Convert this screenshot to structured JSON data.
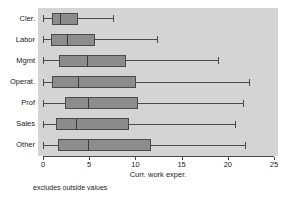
{
  "chart_data": {
    "type": "box",
    "orientation": "horizontal",
    "title": "",
    "xlabel": "Curr. work exper.",
    "ylabel": "",
    "footnote": "excludes outside values",
    "xlim": [
      0,
      25
    ],
    "xticks": [
      0,
      5,
      10,
      15,
      20,
      25
    ],
    "xtick_labels": [
      "0",
      "5",
      "10",
      "15",
      "20",
      "25"
    ],
    "grid": false,
    "legend": null,
    "categories": [
      "Cler.",
      "Labor",
      "Mgmt",
      "Operat.",
      "Prof",
      "Sales",
      "Other"
    ],
    "boxes": [
      {
        "category": "Cler.",
        "whisker_low": 0.0,
        "q1": 1.0,
        "median": 1.9,
        "q3": 3.7,
        "whisker_high": 7.6
      },
      {
        "category": "Labor",
        "whisker_low": 0.0,
        "q1": 0.9,
        "median": 2.7,
        "q3": 5.6,
        "whisker_high": 12.4
      },
      {
        "category": "Mgmt",
        "whisker_low": 0.0,
        "q1": 1.8,
        "median": 4.8,
        "q3": 8.9,
        "whisker_high": 19.0
      },
      {
        "category": "Operat.",
        "whisker_low": 0.0,
        "q1": 1.0,
        "median": 3.8,
        "q3": 10.0,
        "whisker_high": 22.4
      },
      {
        "category": "Prof",
        "whisker_low": 0.0,
        "q1": 2.4,
        "median": 4.9,
        "q3": 10.2,
        "whisker_high": 21.7
      },
      {
        "category": "Sales",
        "whisker_low": 0.0,
        "q1": 1.5,
        "median": 3.6,
        "q3": 9.2,
        "whisker_high": 20.8
      },
      {
        "category": "Other",
        "whisker_low": 0.0,
        "q1": 1.7,
        "median": 4.9,
        "q3": 11.6,
        "whisker_high": 21.9
      }
    ],
    "colors": {
      "plot_background": "#d4d4d4",
      "figure_background": "#ffffff",
      "box_fill": "#8c8c8c",
      "box_edge": "#4a4a4a",
      "median_line": "#3a3a3a",
      "whisker": "#4a4a4a",
      "axis": "#4a4a4a",
      "text": "#1a1a1a"
    }
  }
}
